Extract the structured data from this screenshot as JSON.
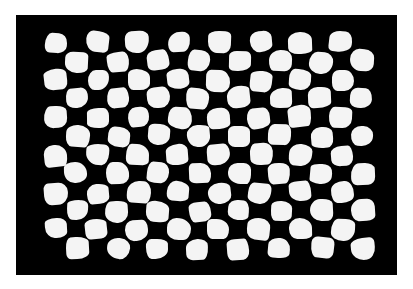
{
  "image": {
    "description": "Distorted black-and-white checkerboard pattern on a black rectangular background, framed by white margins",
    "canvas": {
      "width": 413,
      "height": 289,
      "background": "#ffffff"
    },
    "frame": {
      "x": 16,
      "y": 15,
      "width": 381,
      "height": 260,
      "color": "#000000"
    },
    "board": {
      "x": 46,
      "y": 33,
      "width": 326,
      "height": 225,
      "columns": 16,
      "rows": 12,
      "light_color": "#f4f4f4",
      "dark_color": "#000000",
      "first_cell_light": true,
      "distortion": "wavy, irregular square edges"
    }
  }
}
